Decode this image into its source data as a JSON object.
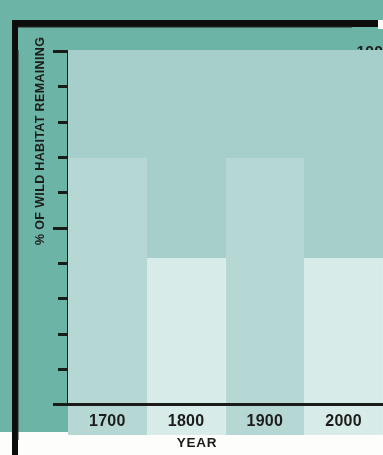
{
  "chart_data": {
    "type": "bar",
    "title": "",
    "subtitle": "",
    "xlabel": "YEAR",
    "ylabel": "% OF WILD HABITAT REMAINING",
    "categories": [
      "1700",
      "1800",
      "1900",
      "2000"
    ],
    "values": [
      95,
      89,
      72,
      46
    ],
    "series": [
      {
        "name": "% of wild habitat remaining",
        "values": [
          95,
          89,
          72,
          46
        ]
      }
    ],
    "ylim": [
      0,
      100
    ],
    "y_major_ticks": [
      0,
      50,
      100
    ],
    "y_major_tick_labels": [
      "0",
      "50",
      "100"
    ],
    "y_minor_ticks": [
      10,
      20,
      30,
      40,
      60,
      70,
      80,
      90
    ],
    "grid": false,
    "legend": false,
    "legend_position": "none",
    "bar_gap": "none",
    "bar_colors": [
      "#6cb4a5",
      "#a6ceca",
      "#b8dad6",
      "#daefeb"
    ],
    "axis_color": "#1b1b1a",
    "background_color": "#fdfdfc",
    "annotations": []
  },
  "axes": {
    "y_labels": [
      "100",
      "50",
      "0"
    ],
    "x_labels": [
      "1700",
      "1800",
      "1900",
      "2000"
    ],
    "y_title": "% OF WILD HABITAT REMAINING",
    "x_title": "YEAR"
  }
}
